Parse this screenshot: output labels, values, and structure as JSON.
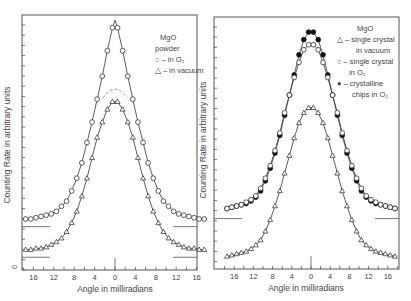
{
  "chart_data": [
    {
      "type": "line",
      "title": "",
      "legend": {
        "title": "MgO",
        "subtitle": "powder",
        "entries": [
          {
            "marker": "open-circle",
            "label": "in O2"
          },
          {
            "marker": "open-triangle",
            "label": "in vacuum"
          }
        ],
        "position": "upper-right"
      },
      "xlabel": "Angle in milliradians",
      "ylabel": "Counting Rate in arbitrary units",
      "xticks": [
        "16",
        "12",
        "8",
        "4",
        "0",
        "4",
        "8",
        "12",
        "16"
      ],
      "xlim": [
        -18,
        18
      ],
      "ylim": [
        0,
        100
      ],
      "grid": false,
      "annotations": [
        "dashed cap near peak of O2 curve (~y 68)",
        "baseline segments at curve tails"
      ],
      "x": [
        -17.5,
        -16.5,
        -15.5,
        -14.5,
        -13.5,
        -12.5,
        -11.5,
        -10.5,
        -9.5,
        -8.5,
        -7.5,
        -6.5,
        -5.5,
        -4.5,
        -3.5,
        -2.5,
        -1.5,
        -0.5,
        0,
        0.5,
        1.5,
        2.5,
        3.5,
        4.5,
        5.5,
        6.5,
        7.5,
        8.5,
        9.5,
        10.5,
        11.5,
        12.5,
        13.5,
        14.5,
        15.5,
        16.5,
        17.5
      ],
      "series": [
        {
          "name": "in O2",
          "marker": "open-circle",
          "values": [
            20,
            20,
            20.5,
            21,
            21.5,
            22,
            23,
            25,
            27,
            31,
            36,
            42,
            50,
            58,
            67,
            76,
            86,
            95,
            98,
            95,
            86,
            76,
            67,
            58,
            50,
            42,
            36,
            31,
            27,
            25,
            23,
            22,
            21.5,
            21,
            20.5,
            20,
            20
          ]
        },
        {
          "name": "in vacuum",
          "marker": "open-triangle",
          "values": [
            8,
            8,
            8.5,
            8.5,
            9,
            10,
            11,
            12.5,
            15,
            18.5,
            23,
            29,
            36,
            44,
            52,
            58,
            63,
            66,
            66,
            66,
            63,
            58,
            52,
            44,
            36,
            29,
            23,
            18.5,
            15,
            12.5,
            11,
            10,
            9,
            8.5,
            8.5,
            8,
            8
          ]
        }
      ],
      "baselines": {
        "in O2": 17,
        "in vacuum": 5
      }
    },
    {
      "type": "line",
      "title": "",
      "legend": {
        "title": "MgO",
        "entries": [
          {
            "marker": "open-triangle",
            "label": "single crystal in vacuum"
          },
          {
            "marker": "open-circle",
            "label": "single crystal in O2"
          },
          {
            "marker": "filled-circle",
            "label": "crystalline chips in O2"
          }
        ],
        "position": "upper-right"
      },
      "xlabel": "Angle in milliradians",
      "ylabel": "Counting Rate in arbitrary units",
      "xticks": [
        "16",
        "12",
        "8",
        "4",
        "0",
        "4",
        "8",
        "12",
        "16"
      ],
      "xlim": [
        -18,
        18
      ],
      "ylim": [
        0,
        100
      ],
      "grid": false,
      "x": [
        -17.5,
        -16.5,
        -15.5,
        -14.5,
        -13.5,
        -12.5,
        -11.5,
        -10.5,
        -9.5,
        -8.5,
        -7.5,
        -6.5,
        -5.5,
        -4.5,
        -3.5,
        -2.5,
        -1.5,
        -0.5,
        0,
        0.5,
        1.5,
        2.5,
        3.5,
        4.5,
        5.5,
        6.5,
        7.5,
        8.5,
        9.5,
        10.5,
        11.5,
        12.5,
        13.5,
        14.5,
        15.5,
        16.5,
        17.5
      ],
      "series": [
        {
          "name": "crystalline chips in O2",
          "marker": "filled-circle",
          "values": [
            24,
            24.5,
            25,
            25.5,
            26,
            27,
            28.5,
            31,
            35,
            40,
            46,
            53,
            61,
            69,
            77,
            85,
            91,
            94,
            94,
            94,
            91,
            85,
            77,
            69,
            61,
            53,
            46,
            40,
            35,
            31,
            28.5,
            27,
            26,
            25.5,
            25,
            24.5,
            24
          ]
        },
        {
          "name": "single crystal in O2",
          "marker": "open-circle",
          "values": [
            24,
            24.5,
            25,
            25.5,
            26.5,
            27.5,
            29,
            32,
            36,
            41,
            47,
            54,
            62,
            69,
            76,
            82,
            87,
            89,
            89,
            89,
            87,
            82,
            76,
            69,
            62,
            54,
            47,
            41,
            36,
            32,
            29,
            27.5,
            26.5,
            25.5,
            25,
            24.5,
            24
          ]
        },
        {
          "name": "single crystal in vacuum",
          "marker": "open-triangle",
          "values": [
            5,
            5.5,
            6,
            6.5,
            7,
            8,
            9.5,
            11.5,
            15,
            19.5,
            25,
            31,
            38,
            45,
            52,
            58,
            62,
            64,
            64,
            64,
            62,
            58,
            52,
            45,
            38,
            31,
            25,
            19.5,
            15,
            11.5,
            9.5,
            8,
            7,
            6.5,
            6,
            5.5,
            5
          ]
        }
      ],
      "baselines": {
        "O2": 20
      }
    }
  ],
  "panels": [
    {
      "ylabel": "Counting Rate in arbitrary units",
      "xlabel": "Angle in milliradians",
      "y_axis_zero_label": "0",
      "legend_lines": [
        "MgO",
        "powder",
        "○ – in O₂",
        "△ – in vacuum"
      ]
    },
    {
      "ylabel": "Counting Rate in arbitrary units",
      "xlabel": "Angle in milliradians",
      "legend_lines": [
        "MgO",
        "△ – single crystal",
        "in vacuum",
        "○ – single crystal",
        "in O₂",
        "● – crystalline",
        "chips in O₂"
      ]
    }
  ],
  "colors": {
    "ink": "#3a3a3a",
    "frame": "#555555",
    "background": "#ffffff"
  }
}
